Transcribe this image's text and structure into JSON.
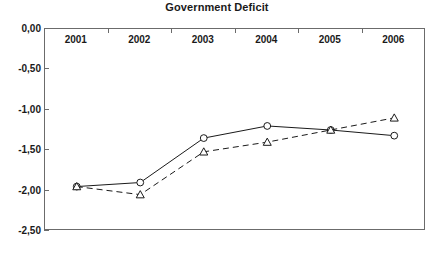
{
  "chart_data": {
    "type": "line",
    "title": "Government Deficit",
    "xlabel": "",
    "ylabel": "",
    "categories": [
      "2001",
      "2002",
      "2003",
      "2004",
      "2005",
      "2006"
    ],
    "ylim": [
      -2.5,
      0.0
    ],
    "ytick_labels": [
      "0,00",
      "-0,50",
      "-1,00",
      "-1,50",
      "-2,00",
      "-2,50"
    ],
    "ytick_values": [
      0.0,
      -0.5,
      -1.0,
      -1.5,
      -2.0,
      -2.5
    ],
    "grid": false,
    "legend": "none",
    "decimal_separator": ",",
    "series": [
      {
        "name": "series-solid",
        "line_style": "solid",
        "marker": "circle",
        "color": "#1a1a1a",
        "values": [
          -1.95,
          -1.9,
          -1.35,
          -1.2,
          -1.25,
          -1.32
        ]
      },
      {
        "name": "series-dashed",
        "line_style": "dashed",
        "marker": "triangle",
        "color": "#1a1a1a",
        "values": [
          -1.95,
          -2.05,
          -1.52,
          -1.4,
          -1.25,
          -1.1
        ]
      }
    ]
  },
  "colors": {
    "axis": "#6b6b6b",
    "text": "#1a1a1a",
    "background": "#ffffff"
  }
}
